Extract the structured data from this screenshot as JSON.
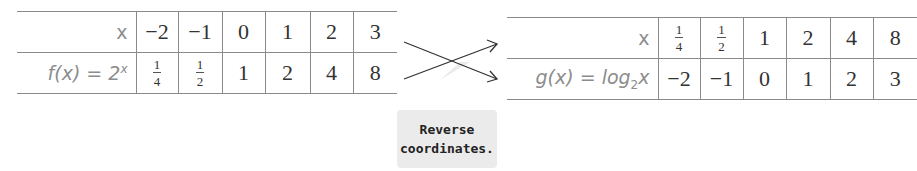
{
  "table_f": {
    "row1_label": "x",
    "row2_label_prefix": "f(x) = 2",
    "row2_label_sup": "x",
    "x_values": [
      "−2",
      "−1",
      "0",
      "1",
      "2",
      "3"
    ],
    "fx_values": [
      {
        "num": "1",
        "den": "4"
      },
      {
        "num": "1",
        "den": "2"
      },
      "1",
      "2",
      "4",
      "8"
    ]
  },
  "table_g": {
    "row1_label": "x",
    "row2_label_prefix": "g(x) = log",
    "row2_label_sub": "2",
    "row2_label_suffix": "x",
    "x_values": [
      {
        "num": "1",
        "den": "4"
      },
      {
        "num": "1",
        "den": "2"
      },
      "1",
      "2",
      "4",
      "8"
    ],
    "gx_values": [
      "−2",
      "−1",
      "0",
      "1",
      "2",
      "3"
    ]
  },
  "callout": {
    "line1": "Reverse",
    "line2": "coordinates."
  },
  "colors": {
    "label_gray": "#8c8c8c",
    "callout_bg": "#ebebeb",
    "border": "#8a8a8a"
  }
}
